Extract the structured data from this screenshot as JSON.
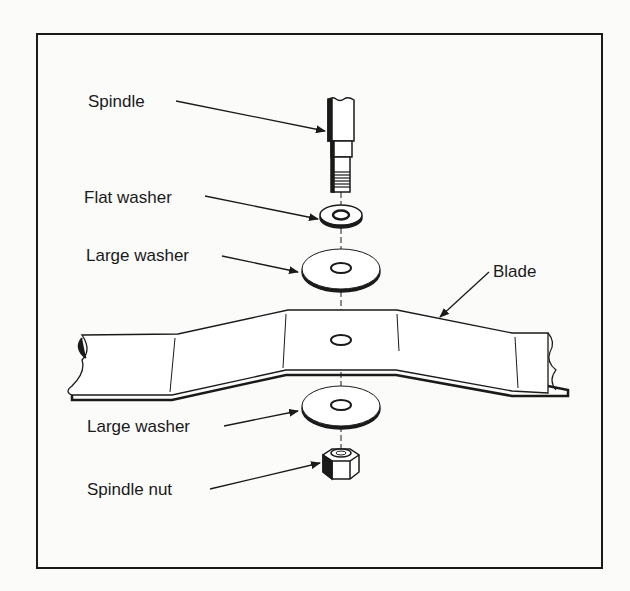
{
  "diagram": {
    "labels": {
      "spindle": "Spindle",
      "flat_washer": "Flat washer",
      "large_washer_top": "Large washer",
      "blade": "Blade",
      "large_washer_bottom": "Large washer",
      "spindle_nut": "Spindle nut"
    },
    "colors": {
      "ink": "#1a1a1a",
      "paper": "#fbfbfa"
    }
  }
}
